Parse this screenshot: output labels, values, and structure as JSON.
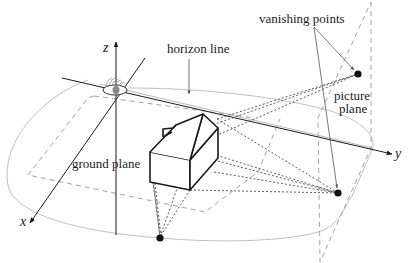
{
  "figure": {
    "type": "perspective-projection-diagram",
    "labels": {
      "z_axis": "z",
      "x_axis": "x",
      "y_axis": "y",
      "horizon_line": "horizon line",
      "vanishing_points": "vanishing points",
      "picture_plane_line1": "picture",
      "picture_plane_line2": "plane",
      "ground_plane": "ground plane"
    },
    "elements": [
      "eye (viewpoint at origin)",
      "z axis",
      "x axis",
      "y axis",
      "horizon line",
      "ground plane outline",
      "ground plane dashed rectangle",
      "picture plane (dashed parallelogram)",
      "house (box with gabled roof and chimney)",
      "vanishing point (upper right)",
      "vanishing point (lower right)",
      "vanishing point (bottom)",
      "projection rays (dotted)"
    ],
    "colors": {
      "ink": "#1a1a1a",
      "light_line": "#b8b8b8",
      "dashed_line": "#8a8a8a"
    }
  }
}
